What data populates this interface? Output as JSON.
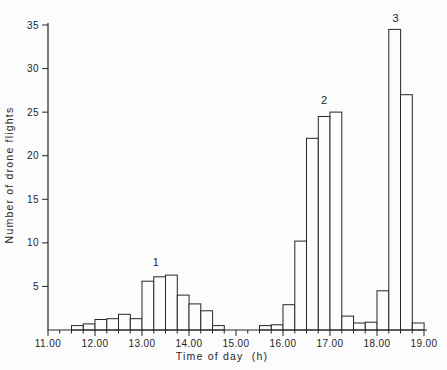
{
  "page": {
    "background_color": "#fcfcfc",
    "line_color": "#262626"
  },
  "chart_data": {
    "type": "bar",
    "subtype": "histogram",
    "title": "",
    "xlabel": "Time of day  (h)",
    "ylabel": "Number of drone flights",
    "xlim": [
      11.0,
      19.0
    ],
    "ylim": [
      0,
      35
    ],
    "grid": false,
    "bar_fill": "#fcfcfc",
    "bar_stroke": "#262626",
    "bin_width_hours": 0.25,
    "x_tick_values": [
      11,
      12,
      13,
      14,
      15,
      16,
      17,
      18,
      19
    ],
    "x_tick_labels": [
      "11.00",
      "12.00",
      "13.00",
      "14.00",
      "15.00",
      "16.00",
      "17.00",
      "18.00",
      "19.00"
    ],
    "x_minor_tick_interval": 0.25,
    "y_tick_values": [
      5,
      10,
      15,
      20,
      25,
      30,
      35
    ],
    "y_tick_labels": [
      "5",
      "10",
      "15",
      "20",
      "25",
      "30",
      "35"
    ],
    "bins": [
      {
        "start": 11.5,
        "count": 0.5
      },
      {
        "start": 11.75,
        "count": 0.7
      },
      {
        "start": 12.0,
        "count": 1.2
      },
      {
        "start": 12.25,
        "count": 1.3
      },
      {
        "start": 12.5,
        "count": 1.8
      },
      {
        "start": 12.75,
        "count": 1.3
      },
      {
        "start": 13.0,
        "count": 5.6
      },
      {
        "start": 13.25,
        "count": 6.1
      },
      {
        "start": 13.5,
        "count": 6.3
      },
      {
        "start": 13.75,
        "count": 4.0
      },
      {
        "start": 14.0,
        "count": 3.0
      },
      {
        "start": 14.25,
        "count": 2.2
      },
      {
        "start": 14.5,
        "count": 0.5
      },
      {
        "start": 14.75,
        "count": 0
      },
      {
        "start": 15.0,
        "count": 0
      },
      {
        "start": 15.25,
        "count": 0
      },
      {
        "start": 15.5,
        "count": 0.5
      },
      {
        "start": 15.75,
        "count": 0.6
      },
      {
        "start": 16.0,
        "count": 2.9
      },
      {
        "start": 16.25,
        "count": 10.2
      },
      {
        "start": 16.5,
        "count": 22
      },
      {
        "start": 16.75,
        "count": 24.5
      },
      {
        "start": 17.0,
        "count": 25
      },
      {
        "start": 17.25,
        "count": 1.6
      },
      {
        "start": 17.5,
        "count": 0.8
      },
      {
        "start": 17.75,
        "count": 0.9
      },
      {
        "start": 18.0,
        "count": 4.5
      },
      {
        "start": 18.25,
        "count": 34.5
      },
      {
        "start": 18.5,
        "count": 27
      },
      {
        "start": 18.75,
        "count": 0.8
      }
    ],
    "annotations": [
      {
        "label": "1",
        "x": 13.3,
        "y": 7.4
      },
      {
        "label": "2",
        "x": 16.88,
        "y": 25.9
      },
      {
        "label": "3",
        "x": 18.4,
        "y": 35.4
      }
    ]
  }
}
